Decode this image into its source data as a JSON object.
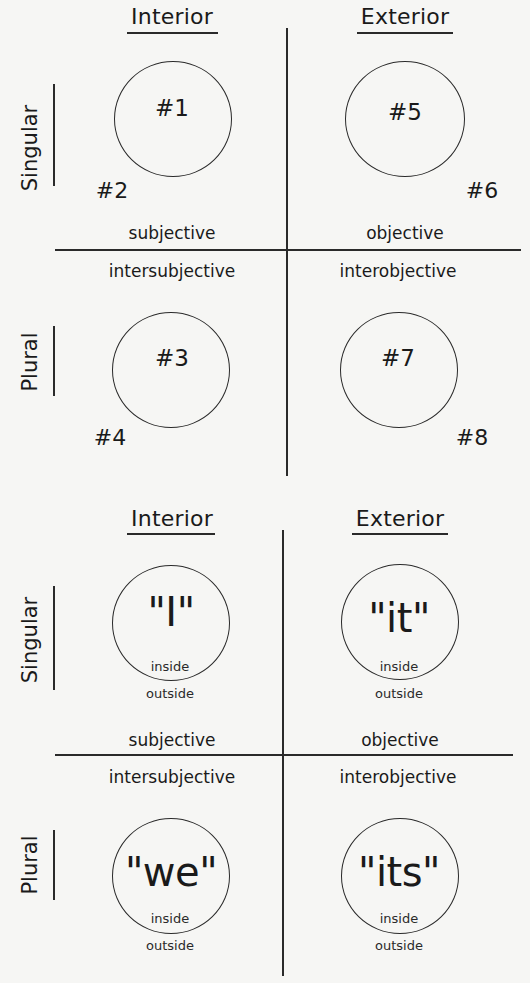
{
  "top_diagram": {
    "columns": [
      "Interior",
      "Exterior"
    ],
    "rows": [
      "Singular",
      "Plural"
    ],
    "quadrant_labels": {
      "upper_left": "subjective",
      "upper_right": "objective",
      "lower_left": "intersubjective",
      "lower_right": "interobjective"
    },
    "circles": [
      {
        "label": "#1"
      },
      {
        "label": "#5"
      },
      {
        "label": "#3"
      },
      {
        "label": "#7"
      }
    ],
    "outer_labels": [
      "#2",
      "#6",
      "#4",
      "#8"
    ]
  },
  "bottom_diagram": {
    "columns": [
      "Interior",
      "Exterior"
    ],
    "rows": [
      "Singular",
      "Plural"
    ],
    "quadrant_labels": {
      "upper_left": "subjective",
      "upper_right": "objective",
      "lower_left": "intersubjective",
      "lower_right": "interobjective"
    },
    "circles": [
      {
        "label": "\"I\"",
        "inside": "inside",
        "outside": "outside"
      },
      {
        "label": "\"it\"",
        "inside": "inside",
        "outside": "outside"
      },
      {
        "label": "\"we\"",
        "inside": "inside",
        "outside": "outside"
      },
      {
        "label": "\"its\"",
        "inside": "inside",
        "outside": "outside"
      }
    ]
  }
}
